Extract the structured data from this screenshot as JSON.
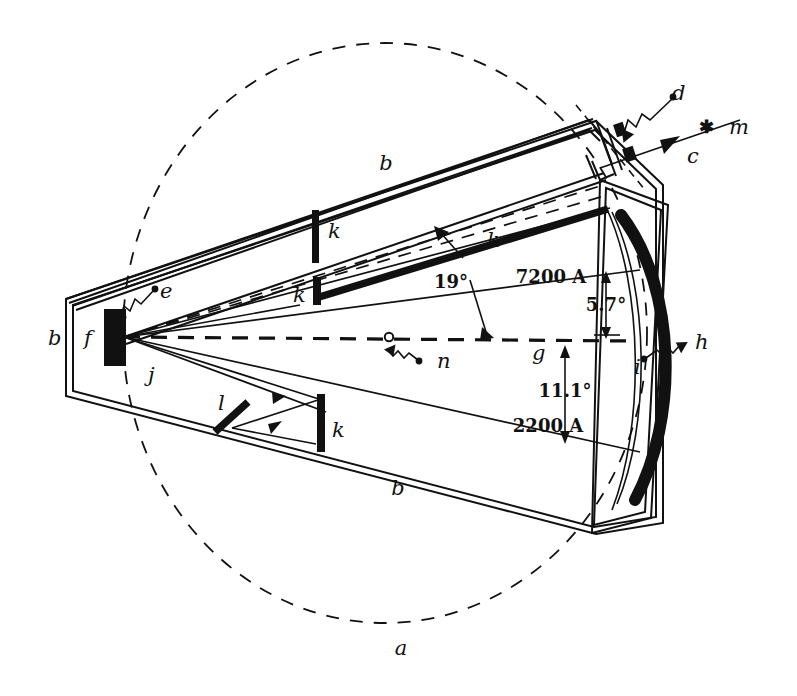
{
  "figure": {
    "background_color": "#ffffff",
    "ink_color": "#111111",
    "width": 797,
    "height": 696
  },
  "labels": {
    "a": "a",
    "b_left": "b",
    "b_top": "b",
    "b_bottom": "b",
    "c": "c",
    "d": "d",
    "e": "e",
    "f": "f",
    "g": "g",
    "h": "h",
    "i": "i",
    "j": "j",
    "k_top": "k",
    "k_mid": "k",
    "k_grating": "k",
    "k_bottom": "k",
    "l": "l",
    "m": "m",
    "n": "n",
    "star_symbol": "✱"
  },
  "annotations": {
    "angle_grating": "19°",
    "angle_upper": "5.7°",
    "angle_lower": "11.1°",
    "wavelength_upper": "7200 A",
    "wavelength_lower": "2200 A"
  },
  "icons": {
    "star_source": "star-icon",
    "arrow_beam": "arrow-icon",
    "squiggle_leader": "squiggle-leader-icon"
  }
}
